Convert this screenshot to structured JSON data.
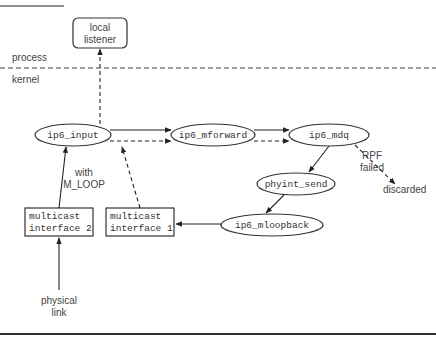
{
  "diagram": {
    "boundary": {
      "upper_label": "process",
      "lower_label": "kernel"
    },
    "nodes": {
      "local_listener": {
        "line1": "local",
        "line2": "listener",
        "shape": "rounded-rect"
      },
      "ip6_input": {
        "label": "ip6_input",
        "shape": "ellipse"
      },
      "ip6_mforward": {
        "label": "ip6_mforward",
        "shape": "ellipse"
      },
      "ip6_mdq": {
        "label": "ip6_mdq",
        "shape": "ellipse"
      },
      "phyint_send": {
        "label": "phyint_send",
        "shape": "ellipse"
      },
      "ip6_mloopback": {
        "label": "ip6_mloopback",
        "shape": "ellipse"
      },
      "multicast_interface_2": {
        "line1": "multicast",
        "line2": "interface 2",
        "shape": "rect"
      },
      "multicast_interface_1": {
        "line1": "multicast",
        "line2": "interface 1",
        "shape": "rect"
      },
      "physical_link": {
        "line1": "physical",
        "line2": "link",
        "shape": "text"
      },
      "discarded": {
        "label": "discarded",
        "shape": "text"
      }
    },
    "annotations": {
      "with_m_loop": {
        "line1": "with",
        "line2": "M_LOOP"
      },
      "rpf_failed": {
        "line1": "RPF",
        "line2": "failed"
      }
    },
    "edges": [
      {
        "from": "physical_link",
        "to": "multicast_interface_2",
        "style": "solid"
      },
      {
        "from": "multicast_interface_2",
        "to": "ip6_input",
        "style": "solid"
      },
      {
        "from": "ip6_input",
        "to": "ip6_mforward",
        "style": "solid"
      },
      {
        "from": "ip6_input",
        "to": "ip6_mforward",
        "style": "dashed"
      },
      {
        "from": "ip6_mforward",
        "to": "ip6_mdq",
        "style": "solid"
      },
      {
        "from": "ip6_mforward",
        "to": "ip6_mdq",
        "style": "dashed"
      },
      {
        "from": "ip6_mdq",
        "to": "phyint_send",
        "style": "solid"
      },
      {
        "from": "ip6_mdq",
        "to": "discarded",
        "style": "dashed",
        "label": "RPF failed"
      },
      {
        "from": "phyint_send",
        "to": "ip6_mloopback",
        "style": "solid"
      },
      {
        "from": "ip6_mloopback",
        "to": "multicast_interface_1",
        "style": "solid"
      },
      {
        "from": "multicast_interface_1",
        "to": "ip6_input",
        "style": "dashed",
        "label": "with M_LOOP"
      },
      {
        "from": "ip6_input",
        "to": "local_listener",
        "style": "dashed"
      }
    ],
    "colors": {
      "line": "#222222",
      "text": "#444444",
      "background": "#ffffff"
    }
  }
}
